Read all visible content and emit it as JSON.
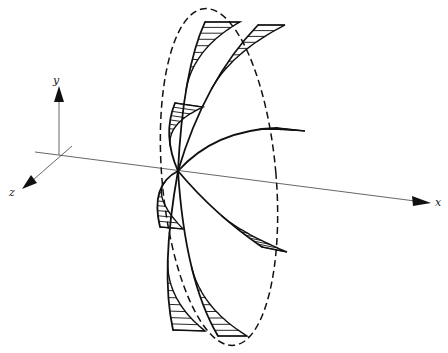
{
  "figure": {
    "axes": {
      "x_label": "x",
      "y_label": "y",
      "z_label": "z"
    },
    "blade_count": 8,
    "colors": {
      "ink": "#111111",
      "axis": "#555555",
      "background": "#ffffff"
    }
  }
}
